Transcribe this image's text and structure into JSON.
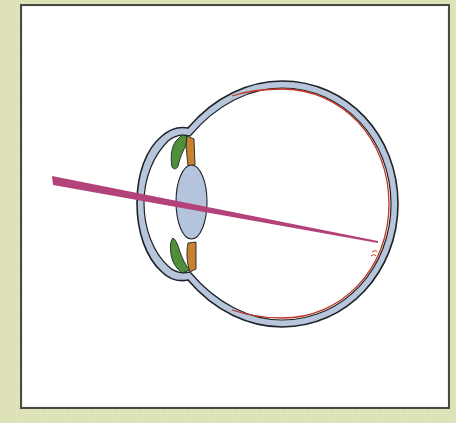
{
  "diagram": {
    "colors": {
      "background": "#dfe3b8",
      "panel": "#ffffff",
      "panel_border": "#4a4a44",
      "sclera_fill": "#b8c6dc",
      "outline": "#1e2228",
      "retina": "#c0321e",
      "lens_fill": "#b4c4dc",
      "ciliary_body": "#4f8f3a",
      "iris": "#c8812f",
      "light_ray": "#b4427a"
    },
    "parts": [
      {
        "id": "sclera",
        "label": "sclera"
      },
      {
        "id": "cornea",
        "label": "cornea"
      },
      {
        "id": "lens",
        "label": "lens"
      },
      {
        "id": "iris-top",
        "label": "iris"
      },
      {
        "id": "iris-bottom",
        "label": "iris"
      },
      {
        "id": "ciliary-top",
        "label": "ciliary body"
      },
      {
        "id": "ciliary-bottom",
        "label": "ciliary body"
      },
      {
        "id": "retina",
        "label": "retina"
      },
      {
        "id": "fovea",
        "label": "fovea"
      },
      {
        "id": "light-ray",
        "label": "light ray"
      }
    ]
  }
}
